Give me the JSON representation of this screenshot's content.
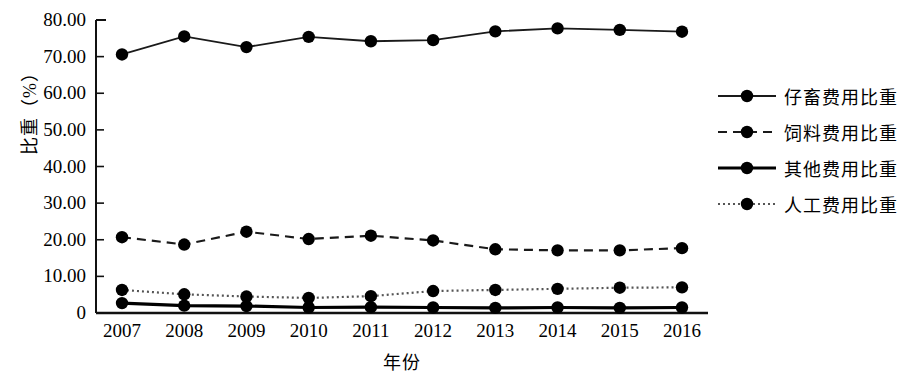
{
  "chart_data": {
    "type": "line",
    "title": "",
    "xlabel": "年份",
    "ylabel": "比重（%）",
    "ylim": [
      0,
      80
    ],
    "y_ticks": [
      "0",
      "10.00",
      "20.00",
      "30.00",
      "40.00",
      "50.00",
      "60.00",
      "70.00",
      "80.00"
    ],
    "y_tick_values": [
      0,
      10,
      20,
      30,
      40,
      50,
      60,
      70,
      80
    ],
    "grid": false,
    "legend_position": "right",
    "categories": [
      "2007",
      "2008",
      "2009",
      "2010",
      "2011",
      "2012",
      "2013",
      "2014",
      "2015",
      "2016"
    ],
    "x": [
      2007,
      2008,
      2009,
      2010,
      2011,
      2012,
      2013,
      2014,
      2015,
      2016
    ],
    "series": [
      {
        "name": "仔畜费用比重",
        "style": "solid",
        "color": "#1a1a1a",
        "marker": "circle",
        "values": [
          70.6,
          75.5,
          72.6,
          75.4,
          74.2,
          74.5,
          76.9,
          77.7,
          77.3,
          76.8
        ]
      },
      {
        "name": "饲料费用比重",
        "style": "dashed",
        "color": "#1a1a1a",
        "marker": "circle",
        "values": [
          20.7,
          18.7,
          22.2,
          20.2,
          21.1,
          19.8,
          17.4,
          17.1,
          17.1,
          17.7
        ]
      },
      {
        "name": "其他费用比重",
        "style": "solid-thick",
        "color": "#000000",
        "marker": "circle",
        "values": [
          2.7,
          2.0,
          1.9,
          1.5,
          1.6,
          1.5,
          1.4,
          1.5,
          1.4,
          1.5
        ]
      },
      {
        "name": "人工费用比重",
        "style": "dotted",
        "color": "#555555",
        "marker": "circle",
        "values": [
          6.3,
          5.1,
          4.5,
          4.1,
          4.6,
          6.0,
          6.3,
          6.6,
          6.9,
          7.0
        ]
      }
    ]
  },
  "legend": {
    "items": [
      {
        "label": "仔畜费用比重"
      },
      {
        "label": "饲料费用比重"
      },
      {
        "label": "其他费用比重"
      },
      {
        "label": "人工费用比重"
      }
    ]
  },
  "axes": {
    "x_title": "年份",
    "y_title": "比重（%）"
  }
}
